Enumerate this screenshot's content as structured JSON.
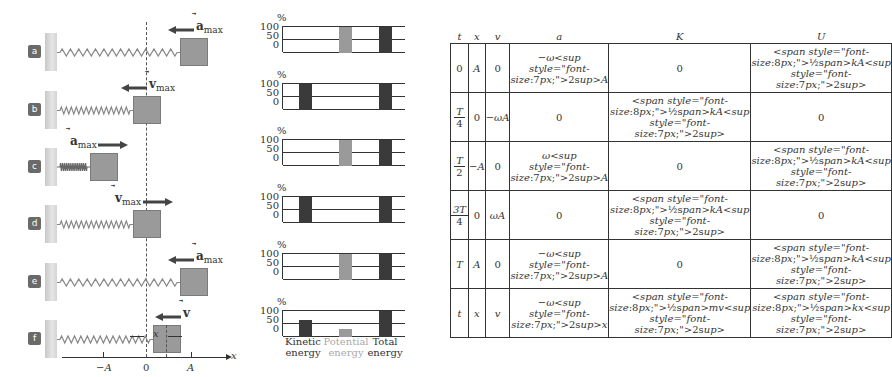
{
  "diagram": {
    "panels": [
      {
        "id": "a",
        "vector": "a",
        "vector_sub": "max",
        "vector_direction": "left",
        "block_x": 180
      },
      {
        "id": "b",
        "vector": "v",
        "vector_sub": "max",
        "vector_direction": "left",
        "block_x": 133
      },
      {
        "id": "c",
        "vector": "a",
        "vector_sub": "max",
        "vector_direction": "right",
        "block_x": 90
      },
      {
        "id": "d",
        "vector": "v",
        "vector_sub": "max",
        "vector_direction": "right",
        "block_x": 133
      },
      {
        "id": "e",
        "vector": "a",
        "vector_sub": "max",
        "vector_direction": "left",
        "block_x": 180
      },
      {
        "id": "f",
        "vector": "v",
        "vector_sub": "",
        "vector_direction": "left",
        "block_x": 153
      }
    ],
    "axis": {
      "label": "x",
      "ticks": [
        "−A",
        "0",
        "A"
      ]
    },
    "displacement_label": "x"
  },
  "chart_data": {
    "type": "bar",
    "categories": [
      "Kinetic energy",
      "Potential energy",
      "Total energy"
    ],
    "ylabel": "%",
    "yticks": [
      0,
      50,
      100
    ],
    "ylim": [
      0,
      100
    ],
    "colors": {
      "kinetic": "#3a3a3a",
      "potential": "#9a9a9a",
      "total": "#3a3a3a"
    },
    "series": [
      {
        "name": "a",
        "values": [
          0,
          100,
          100
        ]
      },
      {
        "name": "b",
        "values": [
          100,
          0,
          100
        ]
      },
      {
        "name": "c",
        "values": [
          0,
          100,
          100
        ]
      },
      {
        "name": "d",
        "values": [
          100,
          0,
          100
        ]
      },
      {
        "name": "e",
        "values": [
          0,
          100,
          100
        ]
      },
      {
        "name": "f",
        "values": [
          65,
          30,
          100
        ]
      }
    ]
  },
  "chart_labels": {
    "kinetic_1": "Kinetic",
    "kinetic_2": "energy",
    "potential_1": "Potential",
    "potential_2": "energy",
    "total_1": "Total",
    "total_2": "energy",
    "pct": "%",
    "y100": "100",
    "y50": "50",
    "y0": "0"
  },
  "table": {
    "headers": [
      "t",
      "x",
      "v",
      "a",
      "K",
      "U"
    ],
    "rows": [
      [
        "0",
        "A",
        "0",
        "−ω²A",
        "0",
        "½kA²"
      ],
      [
        "T/4",
        "0",
        "−ωA",
        "0",
        "½kA²",
        "0"
      ],
      [
        "T/2",
        "−A",
        "0",
        "ω²A",
        "0",
        "½kA²"
      ],
      [
        "3T/4",
        "0",
        "ωA",
        "0",
        "½kA²",
        "0"
      ],
      [
        "T",
        "A",
        "0",
        "−ω²A",
        "0",
        "½kA²"
      ],
      [
        "t",
        "x",
        "v",
        "−ω²x",
        "½mv²",
        "½kx²"
      ]
    ]
  }
}
